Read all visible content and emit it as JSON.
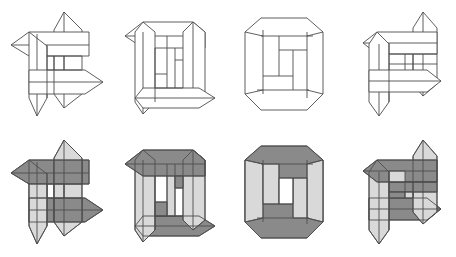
{
  "document": {
    "title": "Interlocking Pinwheel Figures",
    "description": "Eight geometric line drawings of four interlocking prismatic bars arranged in a pinwheel, shown in four progressive assembly stages, rendered twice: unshaded outline (top row) and shaded (bottom row).",
    "background_color": "#ffffff",
    "canvas": {
      "width": 456,
      "height": 257
    }
  },
  "palette": {
    "stroke": "#4d4d4d",
    "outline_fill": "#ffffff",
    "dark_gray": "#8a8a8a",
    "light_gray": "#d9d9d9",
    "mid_gray": "#bfbfbf",
    "hole_white": "#ffffff"
  },
  "grid": {
    "rows": 2,
    "columns": 4,
    "cell_width": 114,
    "cell_height": 128
  },
  "figures": [
    {
      "id": "fig-r1c1",
      "row": 1,
      "column": 1,
      "row_label": "outline",
      "stage": 1,
      "stage_label": "open pinwheel",
      "shaded": false,
      "arms_extended": 4,
      "has_center_hole": false,
      "fills": {
        "horizontal_bars": "#ffffff",
        "vertical_bars": "#ffffff"
      }
    },
    {
      "id": "fig-r1c2",
      "row": 1,
      "column": 2,
      "row_label": "outline",
      "stage": 2,
      "stage_label": "two arms retracted",
      "shaded": false,
      "arms_extended": 2,
      "has_center_hole": false,
      "fills": {
        "horizontal_bars": "#ffffff",
        "vertical_bars": "#ffffff"
      }
    },
    {
      "id": "fig-r1c3",
      "row": 1,
      "column": 3,
      "row_label": "outline",
      "stage": 3,
      "stage_label": "closed octagon ring",
      "shaded": false,
      "arms_extended": 0,
      "has_center_hole": true,
      "fills": {
        "horizontal_bars": "#ffffff",
        "vertical_bars": "#ffffff"
      }
    },
    {
      "id": "fig-r1c4",
      "row": 1,
      "column": 4,
      "row_label": "outline",
      "stage": 4,
      "stage_label": "two arms extended opposite",
      "shaded": false,
      "arms_extended": 2,
      "has_center_hole": false,
      "fills": {
        "horizontal_bars": "#ffffff",
        "vertical_bars": "#ffffff"
      }
    },
    {
      "id": "fig-r2c1",
      "row": 2,
      "column": 1,
      "row_label": "shaded",
      "stage": 1,
      "stage_label": "open pinwheel",
      "shaded": true,
      "arms_extended": 4,
      "has_center_hole": false,
      "fills": {
        "horizontal_bars": "#8a8a8a",
        "vertical_bars": "#d9d9d9"
      }
    },
    {
      "id": "fig-r2c2",
      "row": 2,
      "column": 2,
      "row_label": "shaded",
      "stage": 2,
      "stage_label": "two arms retracted",
      "shaded": true,
      "arms_extended": 2,
      "has_center_hole": false,
      "fills": {
        "horizontal_bars": "#8a8a8a",
        "vertical_bars": "#d9d9d9"
      }
    },
    {
      "id": "fig-r2c3",
      "row": 2,
      "column": 3,
      "row_label": "shaded",
      "stage": 3,
      "stage_label": "closed octagon ring",
      "shaded": true,
      "arms_extended": 0,
      "has_center_hole": true,
      "fills": {
        "horizontal_bars": "#8a8a8a",
        "vertical_bars": "#d9d9d9"
      }
    },
    {
      "id": "fig-r2c4",
      "row": 2,
      "column": 4,
      "row_label": "shaded",
      "stage": 4,
      "stage_label": "two arms extended opposite",
      "shaded": true,
      "arms_extended": 2,
      "has_center_hole": false,
      "fills": {
        "horizontal_bars": "#8a8a8a",
        "vertical_bars": "#d9d9d9"
      }
    }
  ]
}
